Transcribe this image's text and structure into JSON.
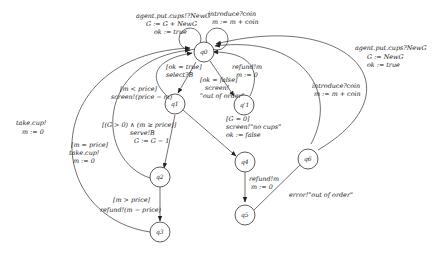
{
  "diagram": {
    "type": "state-machine",
    "colors": {
      "stroke": "#333333",
      "text": "#222222",
      "background": "#ffffff"
    },
    "states": {
      "q0": "q0",
      "q1": "q1",
      "q1p": "q'1",
      "q2": "q2",
      "q3": "q3",
      "q4": "q4",
      "q5": "q5",
      "q6": "q6"
    },
    "labels": {
      "self_agent_1": "agent.put.cups!?NewG",
      "self_agent_2": "G := G + NewG",
      "self_agent_3": "ok := true",
      "self_intro_1": "introduce?coin",
      "self_intro_2": "m := m + coin",
      "q0_q1_1": "[ok = true]",
      "q0_q1_2": "select?B",
      "q1_q0_1": "[m < price]",
      "q1_q0_2": "screen!(price − m)",
      "q0_q1p_1": "[ok = false]",
      "q0_q1p_2": "screen!",
      "q0_q1p_3": "\"out of order\"",
      "q1p_q0_1": "refund!m",
      "q1p_q0_2": "m := 0",
      "q1_q2_1": "[(G > 0) ∧ (m ≥ price)]",
      "q1_q2_2": "serve!B",
      "q1_q2_3": "G := G − 1",
      "q1_q4_1": "[G = 0]",
      "q1_q4_2": "screen!\"no cups\"",
      "q1_q4_3": "ok := false",
      "q2_q0_1": "[m = price]",
      "q2_q0_2": "take.cup!",
      "q2_q0_3": "m := 0",
      "q2_q3_1": "[m > price]",
      "q2_q3_2": "refund!(m − price)",
      "q3_q0_1": "take.cup!",
      "q3_q0_2": "m := 0",
      "q4_q5_1": "refund!m",
      "q4_q5_2": "m := 0",
      "q5_q6": "error!\"out of order\"",
      "q6_q0_intro_1": "introduce?coin",
      "q6_q0_intro_2": "m := m + coin",
      "q6_q0_agent_1": "agent.put.cups?NewG",
      "q6_q0_agent_2": "G := NewG",
      "q6_q0_agent_3": "ok := true"
    }
  }
}
